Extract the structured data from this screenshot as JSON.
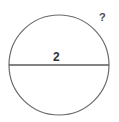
{
  "figure": {
    "kind": "circle-with-diameter-diagram",
    "background_color": "#ffffff",
    "stroke_color": "#6b6b6b",
    "diameter_line_color": "#5a5a5a",
    "text_color": "#333333",
    "circle": {
      "center_x": 59,
      "center_y": 65,
      "radius": 50,
      "stroke_width": 1.2,
      "fill": "none"
    },
    "diameter_line": {
      "x1": 9,
      "y1": 65,
      "x2": 109,
      "y2": 65,
      "stroke_width": 1.6
    },
    "labels": {
      "diameter": "2",
      "unknown": "?"
    }
  },
  "chart_data": {
    "type": "diagram",
    "title": "",
    "shapes": [
      {
        "name": "circle",
        "type": "circle",
        "cx": 59,
        "cy": 65,
        "r": 50
      },
      {
        "name": "diameter",
        "type": "line",
        "x1": 9,
        "y1": 65,
        "x2": 109,
        "y2": 65,
        "length_label": "2"
      }
    ],
    "annotations": [
      {
        "name": "diameter-length",
        "text": "2",
        "x": 57,
        "y": 57,
        "attached_to": "diameter"
      },
      {
        "name": "unknown-quantity",
        "text": "?",
        "x": 103,
        "y": 19,
        "attached_to": "circle"
      }
    ]
  }
}
